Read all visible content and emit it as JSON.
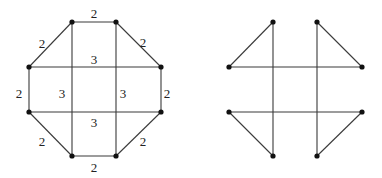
{
  "colors": {
    "edge": "#3a3a3a",
    "node": "#111111",
    "label": "#222222",
    "background": "#ffffff"
  },
  "graphs": [
    {
      "name": "weighted-graph",
      "nodes": [
        {
          "id": "a",
          "x": 72,
          "y": 22
        },
        {
          "id": "b",
          "x": 116,
          "y": 22
        },
        {
          "id": "c",
          "x": 161,
          "y": 67
        },
        {
          "id": "d",
          "x": 161,
          "y": 112
        },
        {
          "id": "e",
          "x": 116,
          "y": 156
        },
        {
          "id": "f",
          "x": 72,
          "y": 156
        },
        {
          "id": "g",
          "x": 29,
          "y": 112
        },
        {
          "id": "h",
          "x": 29,
          "y": 67
        }
      ],
      "edges": [
        {
          "from": "a",
          "to": "b",
          "x1": 72,
          "y1": 22,
          "x2": 116,
          "y2": 22,
          "weight": "2",
          "lx": 94,
          "ly": 13
        },
        {
          "from": "b",
          "to": "c",
          "x1": 116,
          "y1": 22,
          "x2": 161,
          "y2": 67,
          "weight": "2",
          "lx": 143,
          "ly": 42
        },
        {
          "from": "c",
          "to": "d",
          "x1": 161,
          "y1": 67,
          "x2": 161,
          "y2": 112,
          "weight": "2",
          "lx": 167,
          "ly": 93
        },
        {
          "from": "d",
          "to": "e",
          "x1": 161,
          "y1": 112,
          "x2": 116,
          "y2": 156,
          "weight": "2",
          "lx": 143,
          "ly": 141
        },
        {
          "from": "e",
          "to": "f",
          "x1": 116,
          "y1": 156,
          "x2": 72,
          "y2": 156,
          "weight": "2",
          "lx": 94,
          "ly": 167
        },
        {
          "from": "f",
          "to": "g",
          "x1": 72,
          "y1": 156,
          "x2": 29,
          "y2": 112,
          "weight": "2",
          "lx": 42,
          "ly": 141
        },
        {
          "from": "g",
          "to": "h",
          "x1": 29,
          "y1": 112,
          "x2": 29,
          "y2": 67,
          "weight": "2",
          "lx": 19,
          "ly": 93
        },
        {
          "from": "h",
          "to": "a",
          "x1": 29,
          "y1": 67,
          "x2": 72,
          "y2": 22,
          "weight": "2",
          "lx": 42,
          "ly": 43
        },
        {
          "from": "h",
          "to": "c",
          "x1": 29,
          "y1": 67,
          "x2": 161,
          "y2": 67,
          "weight": "3",
          "lx": 94,
          "ly": 59
        },
        {
          "from": "g",
          "to": "d",
          "x1": 29,
          "y1": 112,
          "x2": 161,
          "y2": 112,
          "weight": "3",
          "lx": 94,
          "ly": 122
        },
        {
          "from": "a",
          "to": "f",
          "x1": 72,
          "y1": 22,
          "x2": 72,
          "y2": 156,
          "weight": "3",
          "lx": 62,
          "ly": 93
        },
        {
          "from": "b",
          "to": "e",
          "x1": 116,
          "y1": 22,
          "x2": 116,
          "y2": 156,
          "weight": "3",
          "lx": 123,
          "ly": 93
        }
      ]
    },
    {
      "name": "spanning-subgraph",
      "nodes": [
        {
          "id": "a",
          "x": 273,
          "y": 22
        },
        {
          "id": "b",
          "x": 317,
          "y": 22
        },
        {
          "id": "c",
          "x": 362,
          "y": 67
        },
        {
          "id": "d",
          "x": 362,
          "y": 112
        },
        {
          "id": "e",
          "x": 317,
          "y": 156
        },
        {
          "id": "f",
          "x": 273,
          "y": 156
        },
        {
          "id": "g",
          "x": 229,
          "y": 112
        },
        {
          "id": "h",
          "x": 229,
          "y": 67
        }
      ],
      "edges": [
        {
          "from": "h",
          "to": "a",
          "x1": 229,
          "y1": 67,
          "x2": 273,
          "y2": 22
        },
        {
          "from": "b",
          "to": "c",
          "x1": 317,
          "y1": 22,
          "x2": 362,
          "y2": 67
        },
        {
          "from": "g",
          "to": "f",
          "x1": 229,
          "y1": 112,
          "x2": 273,
          "y2": 156
        },
        {
          "from": "d",
          "to": "e",
          "x1": 362,
          "y1": 112,
          "x2": 317,
          "y2": 156
        },
        {
          "from": "h",
          "to": "c",
          "x1": 229,
          "y1": 67,
          "x2": 362,
          "y2": 67
        },
        {
          "from": "g",
          "to": "d",
          "x1": 229,
          "y1": 112,
          "x2": 362,
          "y2": 112
        },
        {
          "from": "a",
          "to": "f",
          "x1": 273,
          "y1": 22,
          "x2": 273,
          "y2": 156
        },
        {
          "from": "b",
          "to": "e",
          "x1": 317,
          "y1": 22,
          "x2": 317,
          "y2": 156
        }
      ]
    }
  ]
}
